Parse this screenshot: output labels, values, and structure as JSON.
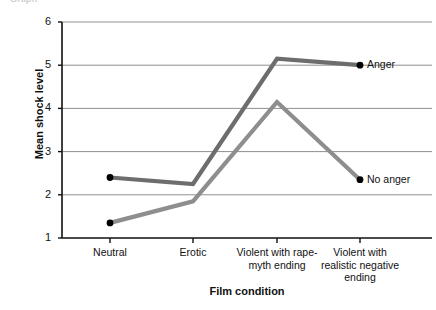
{
  "figure": {
    "cropped_top_text": "Graph",
    "xlabel": "Film condition",
    "ylabel": "Mean shock level"
  },
  "chart_data": {
    "type": "line",
    "title": "",
    "xlabel": "Film condition",
    "ylabel": "Mean shock level",
    "categories": [
      "Neutral",
      "Erotic",
      "Violent with rape-\nmyth ending",
      "Violent with\nrealistic negative\nending"
    ],
    "series": [
      {
        "name": "Anger",
        "values": [
          2.4,
          2.25,
          5.15,
          5.0
        ],
        "color": "#6d6d6d",
        "marker_points": [
          0,
          3
        ]
      },
      {
        "name": "No anger",
        "values": [
          1.35,
          1.85,
          4.15,
          2.35
        ],
        "color": "#8e8e8e",
        "marker_points": [
          0,
          3
        ]
      }
    ],
    "ylim": [
      1,
      6
    ],
    "yticks": [
      1,
      2,
      3,
      4,
      5,
      6
    ],
    "ytick_labels": [
      "1",
      "2",
      "3",
      "4",
      "5",
      "6"
    ],
    "grid": true,
    "gridline_values": [
      2,
      3,
      4,
      5,
      6
    ],
    "legend_position": "inline-right",
    "marker_color": "#000000",
    "axis_color": "#111111",
    "grid_color": "#8f8f8f"
  }
}
